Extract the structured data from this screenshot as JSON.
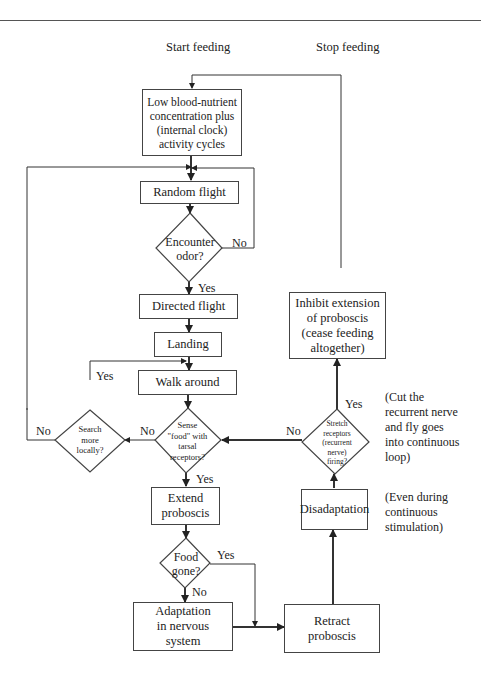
{
  "headers": {
    "start": "Start feeding",
    "stop": "Stop feeding"
  },
  "nodes": {
    "low_blood": "Low blood-nutrient\nconcentration plus\n(internal clock)\nactivity cycles",
    "random_flight": "Random flight",
    "encounter_odor": "Encounter\nodor?",
    "directed_flight": "Directed flight",
    "landing": "Landing",
    "walk_around": "Walk around",
    "sense_food": "Sense\n\"food\" with\ntarsal\nreceptors?",
    "search_locally": "Search\nmore\nlocally?",
    "extend_proboscis": "Extend\nproboscis",
    "food_gone": "Food\ngone?",
    "adaptation": "Adaptation\nin nervous\nsystem",
    "retract_proboscis": "Retract\nproboscis",
    "disadaptation": "Disadaptation",
    "stretch_receptors": "Stretch\nreceptors\n(recurrent\nnerve)\nfiring?",
    "inhibit_extension": "Inhibit extension\nof proboscis\n(cease feeding\naltogether)"
  },
  "edge_labels": {
    "odor_no": "No",
    "odor_yes": "Yes",
    "search_yes": "Yes",
    "search_no": "No",
    "sense_no": "No",
    "sense_yes": "Yes",
    "food_yes": "Yes",
    "food_no": "No",
    "stretch_no": "No",
    "stretch_yes": "Yes"
  },
  "notes": {
    "cut_nerve": "(Cut the\nrecurrent nerve\nand fly goes\ninto continuous\nloop)",
    "even_during": "(Even during\ncontinuous\nstimulation)"
  }
}
